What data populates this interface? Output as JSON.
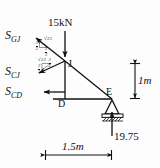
{
  "figure": {
    "background": "#fdfdfd",
    "ink": "#111111"
  },
  "loads": {
    "applied": {
      "label": "15kN",
      "direction": "down",
      "at_joint": "J"
    },
    "reaction": {
      "label": "19.75",
      "direction": "up",
      "at_joint": "E"
    }
  },
  "members": {
    "gj": {
      "label": "S",
      "subscript": "GJ"
    },
    "cj": {
      "label": "S",
      "subscript": "CJ"
    },
    "cd": {
      "label": "S",
      "subscript": "CD"
    }
  },
  "joints": {
    "j": "J",
    "d": "D",
    "e": "E"
  },
  "ratios": {
    "upper": {
      "hyp": "√13",
      "vertical_num": "3",
      "vertical_den": "2",
      "horizontal_num": "2",
      "horizontal_den": "3"
    },
    "lower": {
      "hyp": "√13",
      "vertical_num": "3",
      "vertical_den": "2",
      "horizontal_num": "2",
      "horizontal_den": "3"
    }
  },
  "dimensions": {
    "vertical": "1m",
    "horizontal": "1.5m"
  }
}
